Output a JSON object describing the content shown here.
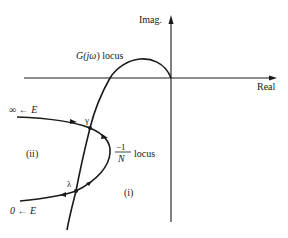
{
  "axes": {
    "x_label": "Real",
    "y_label": "Imag."
  },
  "curves": {
    "g_locus_label_prefix": "G(",
    "g_locus_label_j": "j",
    "g_locus_label_omega": "ω",
    "g_locus_label_suffix": ") locus",
    "describing_locus_numerator": "−1",
    "describing_locus_denominator": "N",
    "describing_locus_suffix": "locus"
  },
  "points": {
    "gamma": "γ",
    "lambda": "λ"
  },
  "regions": {
    "region_i": "(i)",
    "region_ii": "(ii)"
  },
  "endpoints": {
    "top_start": "∞ ← E",
    "bottom_start": "0 ← E"
  },
  "colors": {
    "ink": "#1a1a1a",
    "background": "#ffffff"
  }
}
